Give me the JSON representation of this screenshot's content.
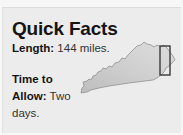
{
  "card": {
    "title": "Quick Facts",
    "facts": [
      {
        "label": "Length:",
        "value": "144 miles."
      },
      {
        "label": "Time to Allow:",
        "value": "Two days."
      }
    ]
  },
  "map": {
    "region": "Kentucky",
    "highlight": "eastern border rectangle",
    "fill_color": "#c9c9c9",
    "outline_color": "#8a8a8a",
    "highlight_color": "#3a3a3a"
  }
}
